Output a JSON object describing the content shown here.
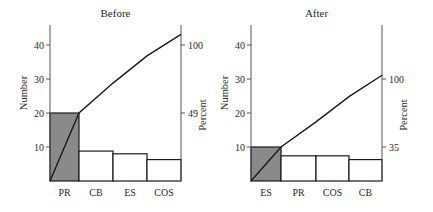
{
  "chart_data": [
    {
      "type": "bar",
      "subtype": "pareto",
      "title": "Before",
      "xlabel": "",
      "ylabel": "Number",
      "y2label": "Percent",
      "categories": [
        "PR",
        "CB",
        "ES",
        "COS"
      ],
      "values": [
        20,
        8.8,
        8.0,
        6.3
      ],
      "cumulative": [
        20,
        28.8,
        36.8,
        43.1
      ],
      "highlighted": "PR",
      "y_ticks": [
        10,
        20,
        30,
        40
      ],
      "y2_ticks": [
        {
          "label": "49",
          "at": 20
        },
        {
          "label": "100",
          "at": 40
        }
      ],
      "ylim": [
        0,
        45
      ],
      "grid": false
    },
    {
      "type": "bar",
      "subtype": "pareto",
      "title": "After",
      "xlabel": "",
      "ylabel": "Number",
      "y2label": "Percent",
      "categories": [
        "ES",
        "PR",
        "COS",
        "CB"
      ],
      "values": [
        10,
        7.4,
        7.4,
        6.3
      ],
      "cumulative": [
        10,
        17.4,
        24.8,
        31.1
      ],
      "highlighted": "ES",
      "y_ticks": [
        10,
        20,
        30,
        40
      ],
      "y2_ticks": [
        {
          "label": "35",
          "at": 10
        },
        {
          "label": "100",
          "at": 30
        }
      ],
      "ylim": [
        0,
        45
      ],
      "grid": false
    }
  ],
  "colors": {
    "highlight_bar": "#8a8a8a",
    "bar": "#ffffff",
    "line": "#1a1a1a",
    "axis": "#555555"
  }
}
